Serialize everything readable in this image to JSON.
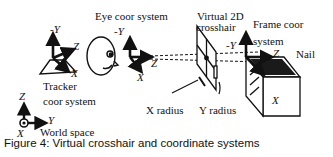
{
  "figure": {
    "caption": "Figure 4: Virtual crosshair and coordinate systems"
  },
  "labels": {
    "eye_coor_system": "Eye coor system",
    "virtual_2d": "Virtual 2D",
    "crosshair": "crosshair",
    "frame_coor": "Frame coor",
    "system": "system",
    "nail": "Nail",
    "tracker": "Tracker",
    "tracker_coor_system": "coor system",
    "x_radius": "X radius",
    "y_radius": "Y radius",
    "world_space": "World space"
  },
  "axes": {
    "tracker": {
      "neg_y": "-Y",
      "z": "Z",
      "x": "X"
    },
    "eye": {
      "neg_y": "-Y",
      "z": "Z",
      "x": "X"
    },
    "frame": {
      "neg_y": "-Y",
      "z": "Z",
      "x": "X"
    },
    "world": {
      "z": "Z",
      "y": "Y",
      "x": "X"
    }
  },
  "colors": {
    "ink": "#111111",
    "background": "#ffffff",
    "nail_fill": "#1a1a1a"
  }
}
